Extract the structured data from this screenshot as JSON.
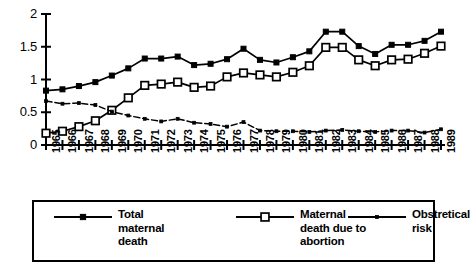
{
  "chart_data": {
    "type": "line",
    "title": "",
    "xlabel": "",
    "ylabel": "",
    "ylim": [
      0,
      2
    ],
    "yticks": [
      "0",
      "0.5",
      "1",
      "1.5",
      "2"
    ],
    "ytick_values": [
      0,
      0.5,
      1,
      1.5,
      2
    ],
    "grid": false,
    "legend_position": "bottom",
    "categories": [
      "1965",
      "1966",
      "1967",
      "1968",
      "1969",
      "1970",
      "1971",
      "1972",
      "1973",
      "1974",
      "1975",
      "1976",
      "1977",
      "1978",
      "1979",
      "1980",
      "1981",
      "1982",
      "1983",
      "1984",
      "1985",
      "1986",
      "1987",
      "1988",
      "1989"
    ],
    "series": [
      {
        "name": "Total maternal death",
        "marker": "filled-square",
        "values": [
          0.83,
          0.85,
          0.9,
          0.96,
          1.06,
          1.17,
          1.32,
          1.32,
          1.35,
          1.22,
          1.24,
          1.31,
          1.47,
          1.3,
          1.26,
          1.34,
          1.43,
          1.73,
          1.73,
          1.51,
          1.39,
          1.53,
          1.53,
          1.59,
          1.73
        ]
      },
      {
        "name": "Maternal death due to abortion",
        "marker": "open-square",
        "values": [
          0.18,
          0.21,
          0.28,
          0.37,
          0.53,
          0.72,
          0.91,
          0.93,
          0.96,
          0.88,
          0.9,
          1.04,
          1.1,
          1.07,
          1.04,
          1.11,
          1.21,
          1.49,
          1.49,
          1.3,
          1.21,
          1.3,
          1.31,
          1.4,
          1.51
        ]
      },
      {
        "name": "Obstretical risk",
        "marker": "small-dot",
        "values": [
          0.67,
          0.63,
          0.64,
          0.61,
          0.51,
          0.45,
          0.4,
          0.36,
          0.4,
          0.34,
          0.32,
          0.28,
          0.35,
          0.22,
          0.21,
          0.21,
          0.2,
          0.22,
          0.23,
          0.21,
          0.2,
          0.22,
          0.22,
          0.19,
          0.24
        ]
      }
    ]
  },
  "legend": {
    "items": [
      {
        "label": "Total\nmaternal\ndeath",
        "marker": "filled-square"
      },
      {
        "label": "Maternal\ndeath due to\nabortion",
        "marker": "open-square"
      },
      {
        "label": "Obstretical\nrisk",
        "marker": "small-dot"
      }
    ]
  },
  "colors": {
    "line": "#000000",
    "background": "#ffffff",
    "axis": "#000000"
  }
}
